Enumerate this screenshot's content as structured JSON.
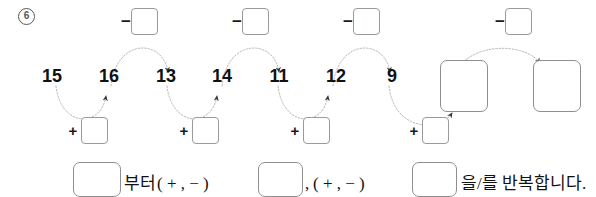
{
  "problem": {
    "number": "6",
    "marker_icon": "circled-number-six"
  },
  "sequence": {
    "numbers": [
      "15",
      "16",
      "13",
      "14",
      "11",
      "12",
      "9"
    ],
    "trailing_blank_count": 2
  },
  "operations": {
    "upper_label_sign": "−",
    "lower_label_sign": "+",
    "upper_count": 4,
    "lower_count": 4,
    "upper_blank_value": "",
    "lower_blank_value": ""
  },
  "answer_sentence": {
    "lead_arrow_icon": "right-arrow-icon",
    "blank1_value": "",
    "text_after_blank1": "부터",
    "paren1": "( + , − )",
    "blank2_value": "",
    "comma": ",",
    "paren2": "( + , − )",
    "blank3_value": "",
    "text_end": "을/를 반복합니다."
  },
  "colors": {
    "text": "#111111",
    "marker": "#585858",
    "box_border": "#9a9a9a",
    "arc": "#b4b4b4",
    "arrow_glyph": "#8a8a8a",
    "background": "#ffffff"
  }
}
